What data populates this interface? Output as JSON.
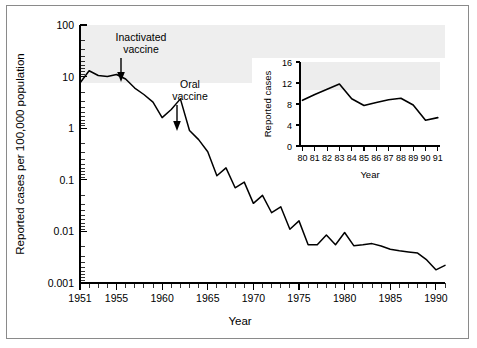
{
  "figure": {
    "background_color": "#ffffff",
    "border_color": "#8a8a8a",
    "line_color": "#000000"
  },
  "chart_data": {
    "type": "line",
    "title": "",
    "xlabel": "Year",
    "ylabel": "Reported cases per 100,000 population",
    "yscale": "log",
    "ylim": [
      0.001,
      100
    ],
    "xlim": [
      1951,
      1991
    ],
    "grid": false,
    "legend": null,
    "ytick_labels": [
      "0.001",
      "0.01",
      "0.1",
      "1",
      "10",
      "100"
    ],
    "ytick_values": [
      0.001,
      0.01,
      0.1,
      1,
      10,
      100
    ],
    "xtick_labels": [
      "1951",
      "1955",
      "1960",
      "1965",
      "1970",
      "1975",
      "1980",
      "1985",
      "1990"
    ],
    "xtick_values": [
      1951,
      1955,
      1960,
      1965,
      1970,
      1975,
      1980,
      1985,
      1990
    ],
    "x": [
      1951,
      1952,
      1953,
      1954,
      1955,
      1956,
      1957,
      1958,
      1959,
      1960,
      1961,
      1962,
      1963,
      1964,
      1965,
      1966,
      1967,
      1968,
      1969,
      1970,
      1971,
      1972,
      1973,
      1974,
      1975,
      1976,
      1977,
      1978,
      1979,
      1980,
      1981,
      1982,
      1983,
      1984,
      1985,
      1986,
      1987,
      1988,
      1989,
      1990,
      1991
    ],
    "values": [
      7.5,
      13.0,
      10.5,
      10.0,
      11.0,
      9.0,
      6.0,
      4.5,
      3.2,
      1.6,
      2.3,
      3.7,
      0.9,
      0.6,
      0.35,
      0.12,
      0.17,
      0.07,
      0.09,
      0.035,
      0.05,
      0.023,
      0.03,
      0.011,
      0.016,
      0.0055,
      0.0055,
      0.0085,
      0.0055,
      0.0095,
      0.0053,
      0.0055,
      0.0058,
      0.0052,
      0.0045,
      0.0042,
      0.004,
      0.0038,
      0.0028,
      0.0018,
      0.0022
    ],
    "annotations": [
      {
        "id": "inactivated-vaccine",
        "text_line1": "Inactivated",
        "text_line2": "vaccine",
        "arrow_year": 1955.5,
        "arrow_points_to": "curve"
      },
      {
        "id": "oral-vaccine",
        "text_line1": "Oral",
        "text_line2": "vaccine",
        "arrow_year": 1962.0,
        "arrow_points_to": "curve"
      }
    ],
    "inset": {
      "type": "line",
      "xlabel": "Year",
      "ylabel": "Reported cases",
      "ylim": [
        0,
        16
      ],
      "ytick_labels": [
        "0",
        "4",
        "8",
        "12",
        "16"
      ],
      "ytick_values": [
        0,
        4,
        8,
        12,
        16
      ],
      "xtick_labels": [
        "80",
        "81",
        "82",
        "83",
        "84",
        "85",
        "86",
        "87",
        "88",
        "89",
        "90",
        "91"
      ],
      "x": [
        80,
        81,
        82,
        83,
        84,
        85,
        86,
        87,
        88,
        89,
        90,
        91
      ],
      "values": [
        8.7,
        9.8,
        10.8,
        11.8,
        9.0,
        7.7,
        8.3,
        8.8,
        9.1,
        7.8,
        4.9,
        5.4
      ]
    }
  }
}
